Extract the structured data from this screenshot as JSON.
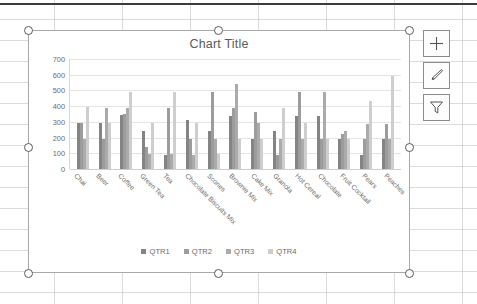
{
  "app": {
    "context": "excel-worksheet-with-selected-chart"
  },
  "chart_object": {
    "selected": true,
    "handles": [
      "top-left",
      "top-center",
      "top-right",
      "middle-left",
      "middle-right",
      "bottom-left",
      "bottom-center",
      "bottom-right"
    ]
  },
  "chart_tools": [
    {
      "name": "chart-elements-button",
      "icon": "plus-icon",
      "tooltip": "Chart Elements"
    },
    {
      "name": "chart-styles-button",
      "icon": "paintbrush-icon",
      "tooltip": "Chart Styles"
    },
    {
      "name": "chart-filters-button",
      "icon": "funnel-icon",
      "tooltip": "Chart Filters"
    }
  ],
  "colors": {
    "qtr1": "#848484",
    "qtr2": "#9c9c9c",
    "qtr3": "#ababab",
    "qtr4": "#cecece",
    "gridline": "#e4e4e4",
    "chart_border": "#a9a9a9",
    "text": "#6b6b6b"
  },
  "chart_data": {
    "type": "bar",
    "title": "Chart Title",
    "xlabel": "",
    "ylabel": "",
    "ylim": [
      0,
      700
    ],
    "yticks": [
      0,
      100,
      200,
      300,
      400,
      500,
      600,
      700
    ],
    "ytick_labels": [
      "0",
      "100",
      "200",
      "300",
      "400",
      "500",
      "600",
      "700"
    ],
    "grid": true,
    "legend_position": "bottom",
    "categories": [
      "Chai",
      "Beer",
      "Coffee",
      "Green Tea",
      "Tea",
      "Chocolate Biscuits Mix",
      "Scones",
      "Brownie Mix",
      "Cake Mix",
      "Granola",
      "Hot Cereal",
      "Chocolate",
      "Fruit Cocktail",
      "Pears",
      "Peaches"
    ],
    "series": [
      {
        "name": "QTR1",
        "color": "#848484",
        "values": [
          290,
          290,
          345,
          245,
          90,
          310,
          240,
          340,
          190,
          240,
          340,
          340,
          190,
          90,
          190
        ]
      },
      {
        "name": "QTR2",
        "color": "#9c9c9c",
        "values": [
          290,
          190,
          350,
          140,
          390,
          190,
          490,
          390,
          360,
          90,
          490,
          190,
          220,
          190,
          285
        ]
      },
      {
        "name": "QTR3",
        "color": "#ababab",
        "values": [
          190,
          390,
          390,
          95,
          95,
          90,
          190,
          540,
          290,
          190,
          190,
          490,
          240,
          285,
          190
        ]
      },
      {
        "name": "QTR4",
        "color": "#cecece",
        "values": [
          395,
          295,
          490,
          290,
          490,
          295,
          95,
          190,
          190,
          390,
          290,
          190,
          190,
          430,
          590
        ]
      }
    ]
  }
}
